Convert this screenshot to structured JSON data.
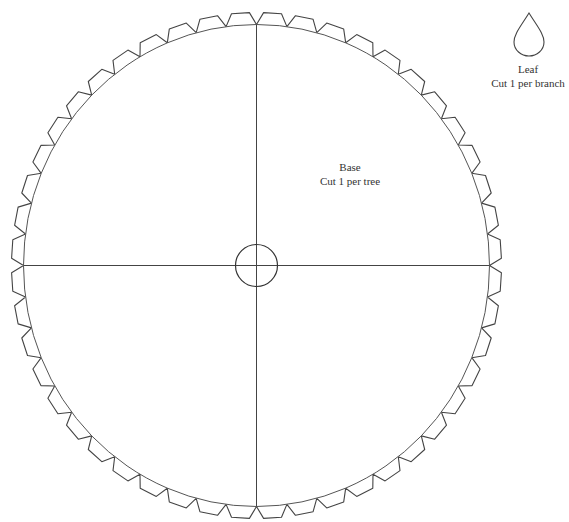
{
  "base": {
    "title": "Base",
    "instruction": "Cut 1 per tree",
    "center": [
      256.5,
      265.5
    ],
    "radius_x": 233,
    "radius_y": 241,
    "tab_count": 48,
    "tab_height": 12,
    "center_circle_radius": 21
  },
  "leaf": {
    "title": "Leaf",
    "instruction": "Cut 1 per branch"
  },
  "colors": {
    "stroke": "#444444",
    "background": "#ffffff",
    "text": "#333333"
  }
}
